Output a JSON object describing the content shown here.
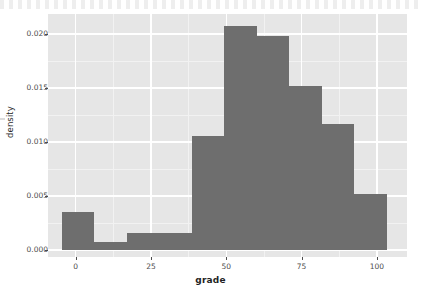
{
  "chart_data": {
    "type": "bar",
    "title": "",
    "subtitle": "",
    "xlabel": "grade",
    "ylabel": "density",
    "xlim": [
      -9.2,
      110.0
    ],
    "ylim": [
      -0.00065,
      0.02185
    ],
    "grid": true,
    "legend": "none",
    "bar_color": "#6e6e6e",
    "panel_color": "#e6e6e6",
    "gridline_color": "#ffffff",
    "x_ticks": [
      {
        "value": 0,
        "label": "0"
      },
      {
        "value": 25,
        "label": "25"
      },
      {
        "value": 50,
        "label": "50"
      },
      {
        "value": 75,
        "label": "75"
      },
      {
        "value": 100,
        "label": "100"
      }
    ],
    "y_ticks": [
      {
        "value": 0.0,
        "label": "0.000"
      },
      {
        "value": 0.005,
        "label": "0.005"
      },
      {
        "value": 0.01,
        "label": "0.010"
      },
      {
        "value": 0.015,
        "label": "0.015"
      },
      {
        "value": 0.02,
        "label": "0.020"
      }
    ],
    "x_minor_ticks": [
      12.5,
      37.5,
      62.5,
      87.5
    ],
    "y_minor_ticks": [
      0.0025,
      0.0075,
      0.0125,
      0.0175
    ],
    "binwidth": 10.8,
    "bins": [
      {
        "x0": -4.7,
        "x1": 6.1,
        "density": 0.0035
      },
      {
        "x0": 6.1,
        "x1": 16.9,
        "density": 0.0007
      },
      {
        "x0": 16.9,
        "x1": 27.7,
        "density": 0.0016
      },
      {
        "x0": 27.7,
        "x1": 38.5,
        "density": 0.0016
      },
      {
        "x0": 38.5,
        "x1": 49.3,
        "density": 0.0106
      },
      {
        "x0": 49.3,
        "x1": 60.1,
        "density": 0.0207
      },
      {
        "x0": 60.1,
        "x1": 70.9,
        "density": 0.0198
      },
      {
        "x0": 70.9,
        "x1": 81.7,
        "density": 0.0152
      },
      {
        "x0": 81.7,
        "x1": 92.5,
        "density": 0.0117
      },
      {
        "x0": 92.5,
        "x1": 103.3,
        "density": 0.0052
      }
    ],
    "categories": [
      "-4.7–6.1",
      "6.1–16.9",
      "16.9–27.7",
      "27.7–38.5",
      "38.5–49.3",
      "49.3–60.1",
      "60.1–70.9",
      "70.9–81.7",
      "81.7–92.5",
      "92.5–103.3"
    ],
    "values": [
      0.0035,
      0.0007,
      0.0016,
      0.0016,
      0.0106,
      0.0207,
      0.0198,
      0.0152,
      0.0117,
      0.0052
    ]
  }
}
